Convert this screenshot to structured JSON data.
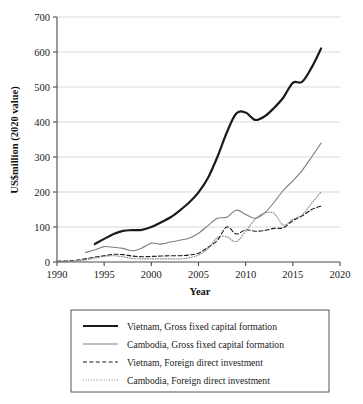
{
  "chart_data": {
    "type": "line",
    "title": "",
    "xlabel": "Year",
    "ylabel": "US$million (2020 value)",
    "xlim": [
      1990,
      2020
    ],
    "ylim": [
      0,
      700
    ],
    "grid": true,
    "legend_position": "bottom",
    "xticks": [
      1990,
      1995,
      2000,
      2005,
      2010,
      2015,
      2020
    ],
    "yticks": [
      0,
      100,
      200,
      300,
      400,
      500,
      600,
      700
    ],
    "series": [
      {
        "name": "Vietnam, Gross fixed capital formation",
        "style": "solid-thick",
        "color": "#1a1a1a",
        "x": [
          1994,
          1995,
          1996,
          1997,
          1998,
          1999,
          2000,
          2001,
          2002,
          2003,
          2004,
          2005,
          2006,
          2007,
          2008,
          2009,
          2010,
          2011,
          2012,
          2013,
          2014,
          2015,
          2016,
          2017,
          2018
        ],
        "values": [
          51,
          66,
          80,
          89,
          91,
          92,
          100,
          113,
          127,
          147,
          170,
          199,
          240,
          300,
          370,
          424,
          427,
          406,
          416,
          440,
          470,
          512,
          515,
          556,
          610
        ]
      },
      {
        "name": "Cambodia, Gross fixed capital formation",
        "style": "solid-thin",
        "color": "#7d7d7d",
        "x": [
          1993,
          1994,
          1995,
          1996,
          1997,
          1998,
          1999,
          2000,
          2001,
          2002,
          2003,
          2004,
          2005,
          2006,
          2007,
          2008,
          2009,
          2010,
          2011,
          2012,
          2013,
          2014,
          2015,
          2016,
          2017,
          2018
        ],
        "values": [
          27,
          34,
          44,
          42,
          39,
          32,
          40,
          54,
          51,
          57,
          62,
          68,
          82,
          104,
          125,
          128,
          148,
          136,
          125,
          140,
          170,
          205,
          232,
          262,
          300,
          340
        ]
      },
      {
        "name": "Vietnam, Foreign direct investment",
        "style": "dashed",
        "color": "#1a1a1a",
        "x": [
          1990,
          1991,
          1992,
          1993,
          1994,
          1995,
          1996,
          1997,
          1998,
          1999,
          2000,
          2001,
          2002,
          2003,
          2004,
          2005,
          2006,
          2007,
          2008,
          2009,
          2010,
          2011,
          2012,
          2013,
          2014,
          2015,
          2016,
          2017,
          2018
        ],
        "values": [
          2,
          3,
          5,
          9,
          14,
          18,
          22,
          21,
          17,
          15,
          16,
          17,
          18,
          18,
          20,
          25,
          42,
          62,
          100,
          80,
          92,
          88,
          90,
          96,
          98,
          118,
          132,
          150,
          160
        ]
      },
      {
        "name": "Cambodia, Foreign direct investment",
        "style": "dotted",
        "color": "#8a8a8a",
        "x": [
          1990,
          1991,
          1992,
          1993,
          1994,
          1995,
          1996,
          1997,
          1998,
          1999,
          2000,
          2001,
          2002,
          2003,
          2004,
          2005,
          2006,
          2007,
          2008,
          2009,
          2010,
          2011,
          2012,
          2013,
          2014,
          2015,
          2016,
          2017,
          2018
        ],
        "values": [
          1,
          1,
          3,
          6,
          11,
          16,
          18,
          15,
          10,
          9,
          9,
          9,
          9,
          9,
          12,
          20,
          38,
          70,
          72,
          58,
          88,
          122,
          140,
          139,
          106,
          122,
          135,
          168,
          200
        ]
      }
    ]
  },
  "axes": {
    "y_title": "US$million (2020 value)",
    "x_title": "Year",
    "x_tick_labels": [
      "1990",
      "1995",
      "2000",
      "2005",
      "2010",
      "2015",
      "2020"
    ],
    "y_tick_labels": [
      "0",
      "100",
      "200",
      "300",
      "400",
      "500",
      "600",
      "700"
    ]
  },
  "legend": {
    "entries": [
      {
        "label": "Vietnam, Gross fixed capital formation"
      },
      {
        "label": "Cambodia, Gross fixed capital formation"
      },
      {
        "label": "Vietnam, Foreign direct investment"
      },
      {
        "label": "Cambodia, Foreign direct investment"
      }
    ]
  }
}
